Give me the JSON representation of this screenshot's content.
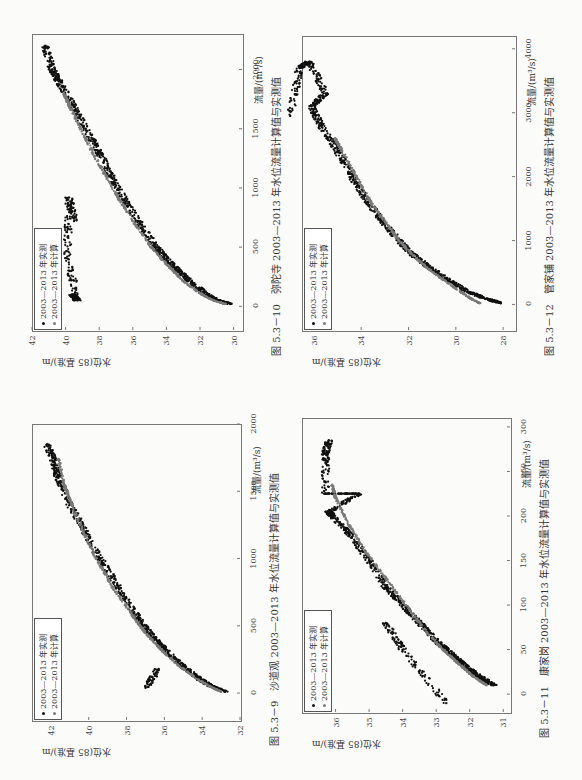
{
  "page": {
    "orientation": "rotated 90° counter-clockwise",
    "colors": {
      "measured": "#111111",
      "computed": "#7a7a7a",
      "frame": "#777777"
    }
  },
  "charts": [
    {
      "id": "fig-5-3-10",
      "caption": "图 5.3－10　弥陀寺 2003—2013 年水位流量计算值与实测值",
      "xlabel": "流量/(m³/s)",
      "ylabel": "水位(85 基准)/m",
      "xticks": [
        "0",
        "500",
        "1000",
        "1500",
        "2000"
      ],
      "yticks": [
        "42",
        "40",
        "38",
        "36",
        "34",
        "32",
        "30"
      ],
      "legend": [
        "2003—2013 年实测",
        "2003—2013 年计算"
      ]
    },
    {
      "id": "fig-5-3-12",
      "caption": "图 5.3－12　管家铺 2003—2013 年水位流量计算值与实测值",
      "xlabel": "流量/(m³/s)",
      "ylabel": "水位(85 基准)/m",
      "xticks": [
        "0",
        "1000",
        "2000",
        "3000",
        "4000"
      ],
      "yticks": [
        "36",
        "34",
        "32",
        "30",
        "28"
      ],
      "legend": [
        "2003—2013 年实测",
        "2003—2013 年计算"
      ]
    },
    {
      "id": "fig-5-3-9",
      "caption": "图 5.3－9　沙道观 2003—2013 年水位流量计算值与实测值",
      "xlabel": "流量/(m³/s)",
      "ylabel": "水位(85 基准)/m",
      "xticks": [
        "0",
        "500",
        "1000",
        "1500",
        "2000"
      ],
      "yticks": [
        "42",
        "40",
        "38",
        "36",
        "34",
        "32"
      ],
      "legend": [
        "2003—2013 年实测",
        "2003—2013 年计算"
      ]
    },
    {
      "id": "fig-5-3-11",
      "caption": "图 5.3－11　康家岗 2003—2013 年水位流量计算值与实测值",
      "xlabel": "流量/(m³/s)",
      "ylabel": "水位(85 基准)/m",
      "xticks": [
        "0",
        "50",
        "100",
        "150",
        "200",
        "250",
        "300"
      ],
      "yticks": [
        "36",
        "35",
        "34",
        "33",
        "32",
        "31"
      ],
      "legend": [
        "2003—2013 年实测",
        "2003—2013 年计算"
      ]
    }
  ],
  "chart_data": [
    {
      "type": "scatter",
      "title": "弥陀寺 2003—2013 年水位流量计算值与实测值",
      "figure_number": "图 5.3-10",
      "xlabel": "流量/(m³/s)",
      "ylabel": "水位(85 基准)/m",
      "xlim": [
        -200,
        2300
      ],
      "ylim": [
        29.5,
        42
      ],
      "xticks": [
        0,
        500,
        1000,
        1500,
        2000
      ],
      "yticks": [
        30,
        32,
        34,
        36,
        38,
        40,
        42
      ],
      "legend": {
        "position": "upper left",
        "entries": [
          "2003—2013 年实测",
          "2003—2013 年计算"
        ]
      },
      "grid": false,
      "series": [
        {
          "name": "2003—2013 年实测",
          "marker": "dot",
          "color": "#111111",
          "points": [
            [
              20,
              30.2
            ],
            [
              50,
              31.0
            ],
            [
              100,
              31.6
            ],
            [
              200,
              32.5
            ],
            [
              300,
              33.3
            ],
            [
              400,
              34.0
            ],
            [
              500,
              34.6
            ],
            [
              700,
              35.6
            ],
            [
              900,
              36.5
            ],
            [
              1100,
              37.3
            ],
            [
              1300,
              38.0
            ],
            [
              1500,
              38.8
            ],
            [
              1700,
              39.6
            ],
            [
              1900,
              40.4
            ],
            [
              2000,
              40.8
            ],
            [
              2200,
              41.2
            ],
            [
              100,
              39.6
            ],
            [
              50,
              39.3
            ],
            [
              420,
              39.9
            ],
            [
              920,
              39.8
            ],
            [
              720,
              39.5
            ]
          ]
        },
        {
          "name": "2003—2013 年计算",
          "marker": "dot",
          "color": "#7a7a7a",
          "points": [
            [
              20,
              30.5
            ],
            [
              50,
              31.2
            ],
            [
              100,
              31.9
            ],
            [
              200,
              32.9
            ],
            [
              300,
              33.6
            ],
            [
              400,
              34.3
            ],
            [
              500,
              34.9
            ],
            [
              700,
              35.9
            ],
            [
              900,
              36.8
            ],
            [
              1100,
              37.6
            ],
            [
              1300,
              38.4
            ],
            [
              1500,
              39.1
            ],
            [
              1700,
              39.8
            ],
            [
              1800,
              40.1
            ]
          ]
        }
      ]
    },
    {
      "type": "scatter",
      "title": "管家铺 2003—2013 年水位流量计算值与实测值",
      "figure_number": "图 5.3-12",
      "xlabel": "流量/(m³/s)",
      "ylabel": "水位(85 基准)/m",
      "xlim": [
        -400,
        4200
      ],
      "ylim": [
        27.5,
        36.5
      ],
      "xticks": [
        0,
        1000,
        2000,
        3000,
        4000
      ],
      "yticks": [
        28,
        30,
        32,
        34,
        36
      ],
      "legend": {
        "position": "upper left",
        "entries": [
          "2003—2013 年实测",
          "2003—2013 年计算"
        ]
      },
      "grid": false,
      "series": [
        {
          "name": "2003—2013 年实测",
          "marker": "dot",
          "color": "#111111",
          "points": [
            [
              20,
              28.1
            ],
            [
              100,
              28.8
            ],
            [
              200,
              29.5
            ],
            [
              400,
              30.4
            ],
            [
              600,
              31.2
            ],
            [
              800,
              31.9
            ],
            [
              1000,
              32.4
            ],
            [
              1300,
              33.1
            ],
            [
              1600,
              33.7
            ],
            [
              2000,
              34.4
            ],
            [
              2400,
              35.0
            ],
            [
              2800,
              35.7
            ],
            [
              3100,
              36.1
            ],
            [
              3300,
              35.5
            ],
            [
              3800,
              36.2
            ],
            [
              3700,
              36.6
            ],
            [
              2950,
              37.0
            ]
          ]
        },
        {
          "name": "2003—2013 年计算",
          "marker": "dot",
          "color": "#7a7a7a",
          "points": [
            [
              20,
              29.0
            ],
            [
              100,
              29.4
            ],
            [
              200,
              29.8
            ],
            [
              400,
              30.6
            ],
            [
              600,
              31.3
            ],
            [
              800,
              31.9
            ],
            [
              1000,
              32.4
            ],
            [
              1300,
              33.0
            ],
            [
              1600,
              33.6
            ],
            [
              2000,
              34.2
            ],
            [
              2400,
              34.8
            ],
            [
              2600,
              35.1
            ]
          ]
        }
      ]
    },
    {
      "type": "scatter",
      "title": "沙道观 2003—2013 年水位流量计算值与实测值",
      "figure_number": "图 5.3-9",
      "xlabel": "流量/(m³/s)",
      "ylabel": "水位(85 基准)/m",
      "xlim": [
        -200,
        2000
      ],
      "ylim": [
        32,
        43
      ],
      "xticks": [
        0,
        500,
        1000,
        1500,
        2000
      ],
      "yticks": [
        32,
        34,
        36,
        38,
        40,
        42
      ],
      "legend": {
        "position": "upper left",
        "entries": [
          "2003—2013 年实测",
          "2003—2013 年计算"
        ]
      },
      "grid": false,
      "series": [
        {
          "name": "2003—2013 年实测",
          "marker": "dot",
          "color": "#111111",
          "points": [
            [
              10,
              32.8
            ],
            [
              50,
              33.5
            ],
            [
              100,
              34.1
            ],
            [
              200,
              35.0
            ],
            [
              300,
              35.8
            ],
            [
              400,
              36.5
            ],
            [
              500,
              37.1
            ],
            [
              600,
              37.6
            ],
            [
              800,
              38.5
            ],
            [
              1000,
              39.4
            ],
            [
              1200,
              40.2
            ],
            [
              1400,
              41.0
            ],
            [
              1600,
              41.6
            ],
            [
              1700,
              41.8
            ],
            [
              1850,
              42.2
            ],
            [
              40,
              37.0
            ],
            [
              180,
              36.3
            ]
          ]
        },
        {
          "name": "2003—2013 年计算",
          "marker": "dot",
          "color": "#7a7a7a",
          "points": [
            [
              10,
              33.0
            ],
            [
              50,
              33.6
            ],
            [
              100,
              34.2
            ],
            [
              200,
              35.2
            ],
            [
              300,
              36.0
            ],
            [
              400,
              36.7
            ],
            [
              500,
              37.3
            ],
            [
              600,
              37.8
            ],
            [
              800,
              38.8
            ],
            [
              1000,
              39.6
            ],
            [
              1200,
              40.3
            ],
            [
              1400,
              40.9
            ],
            [
              1550,
              41.3
            ],
            [
              1740,
              41.6
            ]
          ]
        }
      ]
    },
    {
      "type": "scatter",
      "title": "康家岗 2003—2013 年水位流量计算值与实测值",
      "figure_number": "图 5.3-11",
      "xlabel": "流量/(m³/s)",
      "ylabel": "水位(85 基准)/m",
      "xlim": [
        -20,
        310
      ],
      "ylim": [
        30.8,
        37
      ],
      "xticks": [
        0,
        50,
        100,
        150,
        200,
        250,
        300
      ],
      "yticks": [
        31,
        32,
        33,
        34,
        35,
        36
      ],
      "legend": {
        "position": "upper left",
        "entries": [
          "2003—2013 年实测",
          "2003—2013 年计算"
        ]
      },
      "grid": false,
      "series": [
        {
          "name": "2003—2013 年实测",
          "marker": "dot",
          "color": "#111111",
          "points": [
            [
              10,
              31.3
            ],
            [
              20,
              31.7
            ],
            [
              30,
              32.1
            ],
            [
              40,
              32.4
            ],
            [
              50,
              32.7
            ],
            [
              60,
              33.0
            ],
            [
              80,
              33.5
            ],
            [
              100,
              34.0
            ],
            [
              120,
              34.5
            ],
            [
              150,
              35.0
            ],
            [
              180,
              35.6
            ],
            [
              200,
              36.1
            ],
            [
              205,
              36.2
            ],
            [
              225,
              35.3
            ],
            [
              225,
              36.3
            ],
            [
              270,
              36.3
            ],
            [
              285,
              36.2
            ],
            [
              -10,
              32.7
            ],
            [
              50,
              34.0
            ],
            [
              80,
              34.5
            ]
          ]
        },
        {
          "name": "2003—2013 年计算",
          "marker": "dot",
          "color": "#7a7a7a",
          "points": [
            [
              10,
              31.5
            ],
            [
              20,
              31.9
            ],
            [
              30,
              32.2
            ],
            [
              40,
              32.5
            ],
            [
              50,
              32.8
            ],
            [
              70,
              33.3
            ],
            [
              100,
              33.9
            ],
            [
              130,
              34.5
            ],
            [
              160,
              35.1
            ],
            [
              190,
              35.6
            ],
            [
              220,
              36.0
            ],
            [
              235,
              36.1
            ]
          ]
        }
      ]
    }
  ]
}
